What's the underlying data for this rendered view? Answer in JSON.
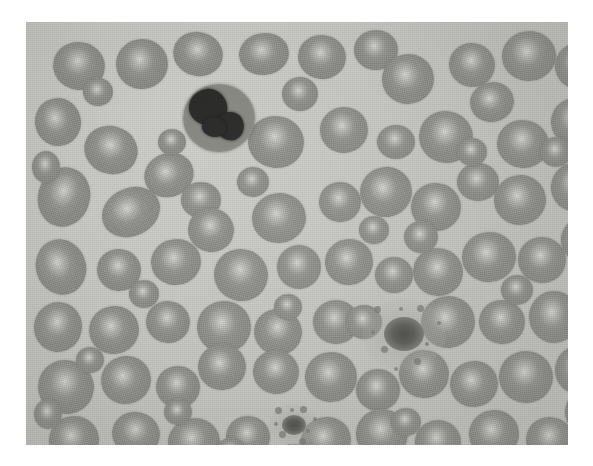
{
  "image": {
    "kind": "micrograph",
    "subject": "peripheral-blood-smear",
    "stain": "grayscale",
    "alt_text": "Grayscale light micrograph of a peripheral blood smear showing numerous red blood cells with central pallor, one white blood cell with a dark lobed nucleus in the upper left, and two platelets",
    "caption": "",
    "frame": {
      "x": 26,
      "y": 22,
      "width": 542,
      "height": 423
    },
    "colors": {
      "plasma_background": "#c9c9c5",
      "rbc_body": "#8b8b87",
      "rbc_central_pallor": "#dcdcd8",
      "wbc_cytoplasm": "#878782",
      "wbc_nucleus": "#2a2a28",
      "platelet": "#555552",
      "page_background": "#ffffff"
    }
  },
  "cells": {
    "white_blood_cells": [
      {
        "name": "neutrophil",
        "cx": 193,
        "cy": 96,
        "rx": 36,
        "ry": 34,
        "nucleus": [
          {
            "cx": 182,
            "cy": 85,
            "rx": 19,
            "ry": 18,
            "rot": -12
          },
          {
            "cx": 204,
            "cy": 104,
            "rx": 14,
            "ry": 14,
            "rot": 20
          },
          {
            "cx": 188,
            "cy": 105,
            "rx": 12,
            "ry": 10,
            "rot": 5
          }
        ]
      }
    ],
    "platelets": [
      {
        "name": "platelet-large-spiculated",
        "cx": 378,
        "cy": 312,
        "rx": 20,
        "ry": 17
      },
      {
        "name": "platelet-small",
        "cx": 268,
        "cy": 403,
        "rx": 12,
        "ry": 10
      }
    ],
    "red_blood_cells": [
      {
        "cx": 53,
        "cy": 44,
        "rx": 26,
        "ry": 24,
        "rot": 10
      },
      {
        "cx": 116,
        "cy": 42,
        "rx": 26,
        "ry": 25,
        "rot": -5
      },
      {
        "cx": 172,
        "cy": 32,
        "rx": 25,
        "ry": 22,
        "rot": 15
      },
      {
        "cx": 238,
        "cy": 32,
        "rx": 25,
        "ry": 21,
        "rot": -8
      },
      {
        "cx": 296,
        "cy": 35,
        "rx": 24,
        "ry": 22,
        "rot": 6
      },
      {
        "cx": 350,
        "cy": 28,
        "rx": 22,
        "ry": 20,
        "rot": 0
      },
      {
        "cx": 382,
        "cy": 57,
        "rx": 26,
        "ry": 25,
        "rot": -10
      },
      {
        "cx": 446,
        "cy": 43,
        "rx": 23,
        "ry": 22,
        "rot": 12
      },
      {
        "cx": 503,
        "cy": 34,
        "rx": 27,
        "ry": 25,
        "rot": -6
      },
      {
        "cx": 552,
        "cy": 44,
        "rx": 23,
        "ry": 23,
        "rot": 0
      },
      {
        "cx": 32,
        "cy": 100,
        "rx": 23,
        "ry": 24,
        "rot": -14
      },
      {
        "cx": 85,
        "cy": 128,
        "rx": 27,
        "ry": 24,
        "rot": 18
      },
      {
        "cx": 143,
        "cy": 153,
        "rx": 25,
        "ry": 22,
        "rot": -20
      },
      {
        "cx": 250,
        "cy": 120,
        "rx": 28,
        "ry": 26,
        "rot": 8
      },
      {
        "cx": 318,
        "cy": 108,
        "rx": 24,
        "ry": 23,
        "rot": -4
      },
      {
        "cx": 370,
        "cy": 120,
        "rx": 19,
        "ry": 17,
        "rot": 0
      },
      {
        "cx": 420,
        "cy": 115,
        "rx": 27,
        "ry": 26,
        "rot": 10
      },
      {
        "cx": 466,
        "cy": 80,
        "rx": 22,
        "ry": 20,
        "rot": -12
      },
      {
        "cx": 497,
        "cy": 122,
        "rx": 26,
        "ry": 24,
        "rot": 7
      },
      {
        "cx": 549,
        "cy": 100,
        "rx": 24,
        "ry": 24,
        "rot": -5
      },
      {
        "cx": 38,
        "cy": 175,
        "rx": 26,
        "ry": 30,
        "rot": 16
      },
      {
        "cx": 105,
        "cy": 190,
        "rx": 30,
        "ry": 24,
        "rot": -25
      },
      {
        "cx": 175,
        "cy": 178,
        "rx": 20,
        "ry": 18,
        "rot": 0
      },
      {
        "cx": 185,
        "cy": 208,
        "rx": 23,
        "ry": 22,
        "rot": 12
      },
      {
        "cx": 253,
        "cy": 196,
        "rx": 27,
        "ry": 25,
        "rot": -8
      },
      {
        "cx": 314,
        "cy": 180,
        "rx": 21,
        "ry": 20,
        "rot": 5
      },
      {
        "cx": 360,
        "cy": 170,
        "rx": 26,
        "ry": 25,
        "rot": -15
      },
      {
        "cx": 410,
        "cy": 185,
        "rx": 25,
        "ry": 24,
        "rot": 9
      },
      {
        "cx": 452,
        "cy": 160,
        "rx": 21,
        "ry": 19,
        "rot": 0
      },
      {
        "cx": 494,
        "cy": 178,
        "rx": 26,
        "ry": 25,
        "rot": -10
      },
      {
        "cx": 548,
        "cy": 165,
        "rx": 23,
        "ry": 24,
        "rot": 6
      },
      {
        "cx": 35,
        "cy": 245,
        "rx": 25,
        "ry": 28,
        "rot": -18
      },
      {
        "cx": 93,
        "cy": 248,
        "rx": 22,
        "ry": 21,
        "rot": 10
      },
      {
        "cx": 150,
        "cy": 240,
        "rx": 25,
        "ry": 23,
        "rot": -6
      },
      {
        "cx": 215,
        "cy": 253,
        "rx": 27,
        "ry": 26,
        "rot": 14
      },
      {
        "cx": 273,
        "cy": 245,
        "rx": 22,
        "ry": 22,
        "rot": 0
      },
      {
        "cx": 323,
        "cy": 240,
        "rx": 24,
        "ry": 23,
        "rot": -9
      },
      {
        "cx": 368,
        "cy": 253,
        "rx": 19,
        "ry": 18,
        "rot": 0
      },
      {
        "cx": 412,
        "cy": 250,
        "rx": 25,
        "ry": 24,
        "rot": 11
      },
      {
        "cx": 463,
        "cy": 235,
        "rx": 27,
        "ry": 25,
        "rot": -7
      },
      {
        "cx": 516,
        "cy": 238,
        "rx": 24,
        "ry": 23,
        "rot": 5
      },
      {
        "cx": 556,
        "cy": 218,
        "rx": 21,
        "ry": 22,
        "rot": 0
      },
      {
        "cx": 32,
        "cy": 305,
        "rx": 24,
        "ry": 25,
        "rot": 12
      },
      {
        "cx": 88,
        "cy": 308,
        "rx": 25,
        "ry": 24,
        "rot": -14
      },
      {
        "cx": 142,
        "cy": 300,
        "rx": 22,
        "ry": 21,
        "rot": 8
      },
      {
        "cx": 198,
        "cy": 305,
        "rx": 27,
        "ry": 26,
        "rot": -5
      },
      {
        "cx": 252,
        "cy": 310,
        "rx": 24,
        "ry": 23,
        "rot": 16
      },
      {
        "cx": 310,
        "cy": 300,
        "rx": 23,
        "ry": 22,
        "rot": 0
      },
      {
        "cx": 422,
        "cy": 300,
        "rx": 27,
        "ry": 26,
        "rot": -11
      },
      {
        "cx": 476,
        "cy": 300,
        "rx": 23,
        "ry": 22,
        "rot": 7
      },
      {
        "cx": 528,
        "cy": 295,
        "rx": 25,
        "ry": 26,
        "rot": -4
      },
      {
        "cx": 40,
        "cy": 365,
        "rx": 28,
        "ry": 27,
        "rot": 10
      },
      {
        "cx": 100,
        "cy": 358,
        "rx": 25,
        "ry": 24,
        "rot": -16
      },
      {
        "cx": 152,
        "cy": 365,
        "rx": 22,
        "ry": 21,
        "rot": 4
      },
      {
        "cx": 196,
        "cy": 345,
        "rx": 24,
        "ry": 23,
        "rot": -8
      },
      {
        "cx": 250,
        "cy": 350,
        "rx": 23,
        "ry": 22,
        "rot": 12
      },
      {
        "cx": 305,
        "cy": 355,
        "rx": 26,
        "ry": 25,
        "rot": -6
      },
      {
        "cx": 352,
        "cy": 368,
        "rx": 22,
        "ry": 21,
        "rot": 0
      },
      {
        "cx": 398,
        "cy": 352,
        "rx": 25,
        "ry": 24,
        "rot": 9
      },
      {
        "cx": 448,
        "cy": 362,
        "rx": 24,
        "ry": 23,
        "rot": -12
      },
      {
        "cx": 500,
        "cy": 355,
        "rx": 27,
        "ry": 26,
        "rot": 5
      },
      {
        "cx": 552,
        "cy": 348,
        "rx": 23,
        "ry": 24,
        "rot": 0
      },
      {
        "cx": 48,
        "cy": 418,
        "rx": 25,
        "ry": 24,
        "rot": -10
      },
      {
        "cx": 110,
        "cy": 412,
        "rx": 24,
        "ry": 22,
        "rot": 14
      },
      {
        "cx": 168,
        "cy": 420,
        "rx": 26,
        "ry": 24,
        "rot": -7
      },
      {
        "cx": 222,
        "cy": 415,
        "rx": 22,
        "ry": 21,
        "rot": 6
      },
      {
        "cx": 300,
        "cy": 418,
        "rx": 25,
        "ry": 23,
        "rot": -13
      },
      {
        "cx": 356,
        "cy": 412,
        "rx": 26,
        "ry": 25,
        "rot": 8
      },
      {
        "cx": 412,
        "cy": 420,
        "rx": 23,
        "ry": 22,
        "rot": 0
      },
      {
        "cx": 468,
        "cy": 412,
        "rx": 25,
        "ry": 24,
        "rot": -9
      },
      {
        "cx": 524,
        "cy": 418,
        "rx": 24,
        "ry": 23,
        "rot": 11
      },
      {
        "cx": 560,
        "cy": 390,
        "rx": 21,
        "ry": 22,
        "rot": 0
      },
      {
        "cx": 227,
        "cy": 160,
        "rx": 16,
        "ry": 15,
        "rot": 0
      },
      {
        "cx": 338,
        "cy": 300,
        "rx": 18,
        "ry": 17,
        "rot": 0
      },
      {
        "cx": 395,
        "cy": 215,
        "rx": 17,
        "ry": 16,
        "rot": 0
      },
      {
        "cx": 72,
        "cy": 70,
        "rx": 15,
        "ry": 14,
        "rot": 0
      },
      {
        "cx": 274,
        "cy": 72,
        "rx": 18,
        "ry": 17,
        "rot": 0
      },
      {
        "cx": 530,
        "cy": 130,
        "rx": 16,
        "ry": 15,
        "rot": 0
      },
      {
        "cx": 146,
        "cy": 120,
        "rx": 14,
        "ry": 13,
        "rot": 0
      },
      {
        "cx": 205,
        "cy": 430,
        "rx": 16,
        "ry": 14,
        "rot": 0
      },
      {
        "cx": 446,
        "cy": 130,
        "rx": 15,
        "ry": 14,
        "rot": 0
      },
      {
        "cx": 64,
        "cy": 338,
        "rx": 14,
        "ry": 13,
        "rot": 0
      },
      {
        "cx": 348,
        "cy": 208,
        "rx": 15,
        "ry": 14,
        "rot": 0
      },
      {
        "cx": 262,
        "cy": 285,
        "rx": 14,
        "ry": 13,
        "rot": 0
      },
      {
        "cx": 491,
        "cy": 268,
        "rx": 16,
        "ry": 15,
        "rot": 0
      },
      {
        "cx": 118,
        "cy": 272,
        "rx": 15,
        "ry": 14,
        "rot": 0
      },
      {
        "cx": 380,
        "cy": 400,
        "rx": 15,
        "ry": 14,
        "rot": 0
      },
      {
        "cx": 152,
        "cy": 390,
        "rx": 14,
        "ry": 13,
        "rot": 0
      },
      {
        "cx": 566,
        "cy": 275,
        "rx": 15,
        "ry": 16,
        "rot": 0
      },
      {
        "cx": 20,
        "cy": 145,
        "rx": 14,
        "ry": 16,
        "rot": 0
      },
      {
        "cx": 22,
        "cy": 392,
        "rx": 14,
        "ry": 15,
        "rot": 0
      },
      {
        "cx": 270,
        "cy": 435,
        "rx": 15,
        "ry": 13,
        "rot": 0
      },
      {
        "cx": 440,
        "cy": 437,
        "rx": 16,
        "ry": 13,
        "rot": 0
      }
    ]
  }
}
